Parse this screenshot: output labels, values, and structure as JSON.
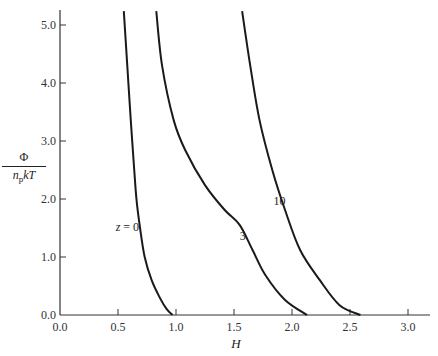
{
  "chart_data": {
    "type": "line",
    "title": "",
    "xlabel": "H",
    "ylabel": "Φ / (n_p kT)",
    "ylabel_parts": {
      "numerator": "Φ",
      "denominator_pre": "n",
      "denominator_sub": "p",
      "denominator_post": "kT"
    },
    "xlim": [
      0.0,
      3.2
    ],
    "ylim": [
      0.0,
      5.3
    ],
    "xticks": [
      0.0,
      0.5,
      1.0,
      1.5,
      2.0,
      2.5,
      3.0
    ],
    "xtick_labels": [
      "0.0",
      "0.5",
      "1.0",
      "1.5",
      "2.0",
      "2.5",
      "3.0"
    ],
    "yticks": [
      0.0,
      1.0,
      2.0,
      3.0,
      4.0,
      5.0
    ],
    "ytick_labels": [
      "0.0",
      "1.0",
      "2.0",
      "3.0",
      "4.0",
      "5.0"
    ],
    "grid": false,
    "legend": "inline labels on curves",
    "series": [
      {
        "name": "z = 0",
        "label": "z = 0",
        "label_pos": [
          0.48,
          1.45
        ],
        "points": [
          [
            0.55,
            5.24
          ],
          [
            0.58,
            4.3
          ],
          [
            0.61,
            3.36
          ],
          [
            0.64,
            2.5
          ],
          [
            0.66,
            1.98
          ],
          [
            0.69,
            1.5
          ],
          [
            0.73,
            1.0
          ],
          [
            0.79,
            0.6
          ],
          [
            0.86,
            0.3
          ],
          [
            0.92,
            0.1
          ],
          [
            0.97,
            0.0
          ]
        ]
      },
      {
        "name": "z = 3",
        "label": "3",
        "label_pos": [
          1.55,
          1.3
        ],
        "points": [
          [
            0.83,
            5.24
          ],
          [
            0.88,
            4.3
          ],
          [
            0.98,
            3.36
          ],
          [
            1.08,
            2.84
          ],
          [
            1.25,
            2.24
          ],
          [
            1.42,
            1.81
          ],
          [
            1.55,
            1.55
          ],
          [
            1.66,
            1.12
          ],
          [
            1.77,
            0.69
          ],
          [
            1.94,
            0.26
          ],
          [
            2.13,
            0.0
          ]
        ]
      },
      {
        "name": "z = 10",
        "label": "10",
        "label_pos": [
          1.84,
          1.9
        ],
        "points": [
          [
            1.57,
            5.24
          ],
          [
            1.64,
            4.3
          ],
          [
            1.72,
            3.36
          ],
          [
            1.83,
            2.5
          ],
          [
            1.94,
            1.81
          ],
          [
            2.07,
            1.12
          ],
          [
            2.24,
            0.6
          ],
          [
            2.41,
            0.17
          ],
          [
            2.59,
            0.0
          ]
        ]
      }
    ]
  }
}
